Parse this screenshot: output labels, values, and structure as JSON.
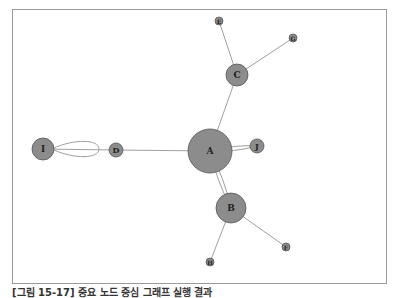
{
  "figure": {
    "caption": "[그림 15-17] 중요 노드 중심 그래프 실행 결과"
  },
  "graph": {
    "node_fill": "#8c8c8c",
    "node_stroke": "#555555",
    "edge_color": "#a0a0a0",
    "nodes": [
      {
        "id": "A",
        "label": "A",
        "x": 210,
        "y": 151,
        "r": 22
      },
      {
        "id": "B",
        "label": "B",
        "x": 231,
        "y": 208,
        "r": 15
      },
      {
        "id": "C",
        "label": "C",
        "x": 237,
        "y": 75,
        "r": 11
      },
      {
        "id": "D",
        "label": "D",
        "x": 116,
        "y": 150,
        "r": 7
      },
      {
        "id": "I",
        "label": "I",
        "x": 43,
        "y": 149,
        "r": 11
      },
      {
        "id": "J",
        "label": "J",
        "x": 257,
        "y": 146,
        "r": 7
      },
      {
        "id": "E",
        "label": "E",
        "x": 219,
        "y": 21,
        "r": 4
      },
      {
        "id": "G",
        "label": "G",
        "x": 293,
        "y": 38,
        "r": 4
      },
      {
        "id": "F",
        "label": "F",
        "x": 286,
        "y": 247,
        "r": 4
      },
      {
        "id": "H",
        "label": "H",
        "x": 210,
        "y": 262,
        "r": 4
      }
    ],
    "edges": [
      {
        "from": "I",
        "to": "D"
      },
      {
        "from": "D",
        "to": "A"
      },
      {
        "from": "A",
        "to": "C"
      },
      {
        "from": "C",
        "to": "E"
      },
      {
        "from": "C",
        "to": "G"
      },
      {
        "from": "A",
        "to": "J",
        "multi": true
      },
      {
        "from": "A",
        "to": "B",
        "multi": true
      },
      {
        "from": "B",
        "to": "F"
      },
      {
        "from": "B",
        "to": "H"
      },
      {
        "from": "I",
        "to": "I",
        "loop": true
      }
    ]
  }
}
